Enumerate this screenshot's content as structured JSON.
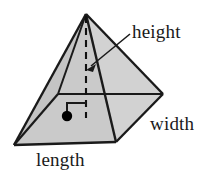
{
  "figure": {
    "name": "rectangular-pyramid-dimensions-diagram",
    "background_color": "#ffffff",
    "edge_color": "#1a1a1a",
    "labels": {
      "height": "height",
      "width": "width",
      "length": "length"
    },
    "colors": {
      "face_front_left": "#c9c9c9",
      "face_front_right": "#d4d4d4",
      "face_back_right": "#a6a6a6",
      "face_base_left": "#bfbfbf",
      "base_right": "#b0b0b0",
      "stroke": "#1a1a1a",
      "dash": "#111111",
      "dot": "#000000"
    },
    "geometry": {
      "apex": [
        86,
        14
      ],
      "vertex_left": [
        14,
        145
      ],
      "vertex_front": [
        116,
        142
      ],
      "vertex_right": [
        163,
        94
      ],
      "vertex_back": [
        58,
        94
      ],
      "center": [
        67,
        116
      ],
      "height_foot": [
        86,
        116
      ]
    },
    "annotations": {
      "right_angle_marker": "square corner at base center showing height perpendicular to base",
      "height_leader_arrow": "arrow from height label pointing down-left to dashed altitude",
      "center_dot": "filled dot marking center of rectangular base"
    }
  }
}
